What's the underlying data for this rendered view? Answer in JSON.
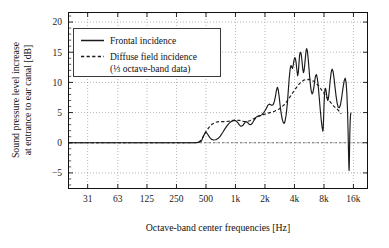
{
  "chart_data": {
    "type": "line",
    "title": "",
    "xlabel": "Octave-band center frequencies [Hz]",
    "ylabel": "Sound pressure level increase at entrance to ear canal [dB]",
    "ylabel_line1": "Sound pressure level increase",
    "ylabel_line2": "at entrance to ear canal [dB]",
    "xscale": "log",
    "xlim": [
      20,
      22000
    ],
    "ylim": [
      -7.5,
      21.5
    ],
    "grid": true,
    "legend_position": "upper-left-inside",
    "xticks": [
      31,
      63,
      125,
      250,
      500,
      1000,
      2000,
      4000,
      8000,
      16000
    ],
    "xticklabels": [
      "31",
      "63",
      "125",
      "250",
      "500",
      "1k",
      "2k",
      "4k",
      "8k",
      "16k"
    ],
    "yticks": [
      -5,
      0,
      5,
      10,
      15,
      20
    ],
    "yticklabels": [
      "−5",
      "0",
      "5",
      "10",
      "15",
      "20"
    ],
    "series": [
      {
        "name": "Frontal incidence",
        "style": "solid",
        "color": "#1a1a1a",
        "points": [
          [
            20,
            0.0
          ],
          [
            100,
            0.0
          ],
          [
            200,
            0.0
          ],
          [
            300,
            0.0
          ],
          [
            380,
            0.0
          ],
          [
            420,
            0.05
          ],
          [
            450,
            0.3
          ],
          [
            470,
            1.1
          ],
          [
            490,
            1.6
          ],
          [
            505,
            1.7
          ],
          [
            520,
            1.4
          ],
          [
            545,
            0.9
          ],
          [
            570,
            0.55
          ],
          [
            600,
            0.45
          ],
          [
            630,
            0.5
          ],
          [
            670,
            0.75
          ],
          [
            700,
            1.1
          ],
          [
            740,
            1.7
          ],
          [
            780,
            2.3
          ],
          [
            820,
            2.8
          ],
          [
            860,
            3.2
          ],
          [
            900,
            3.5
          ],
          [
            940,
            3.65
          ],
          [
            980,
            3.7
          ],
          [
            1020,
            3.6
          ],
          [
            1060,
            3.3
          ],
          [
            1090,
            3.0
          ],
          [
            1120,
            2.8
          ],
          [
            1160,
            2.75
          ],
          [
            1200,
            2.95
          ],
          [
            1240,
            3.3
          ],
          [
            1280,
            3.5
          ],
          [
            1320,
            3.4
          ],
          [
            1360,
            3.15
          ],
          [
            1400,
            3.0
          ],
          [
            1450,
            3.05
          ],
          [
            1500,
            3.35
          ],
          [
            1560,
            3.8
          ],
          [
            1620,
            4.2
          ],
          [
            1680,
            4.4
          ],
          [
            1740,
            4.45
          ],
          [
            1800,
            4.5
          ],
          [
            1870,
            4.7
          ],
          [
            1940,
            5.0
          ],
          [
            2000,
            5.3
          ],
          [
            2070,
            5.7
          ],
          [
            2140,
            6.2
          ],
          [
            2210,
            6.4
          ],
          [
            2280,
            6.3
          ],
          [
            2350,
            6.2
          ],
          [
            2420,
            6.3
          ],
          [
            2490,
            6.8
          ],
          [
            2560,
            7.7
          ],
          [
            2620,
            8.7
          ],
          [
            2680,
            9.2
          ],
          [
            2730,
            8.8
          ],
          [
            2790,
            7.7
          ],
          [
            2850,
            6.3
          ],
          [
            2920,
            5.0
          ],
          [
            2990,
            4.0
          ],
          [
            3060,
            3.4
          ],
          [
            3130,
            3.2
          ],
          [
            3200,
            3.5
          ],
          [
            3290,
            4.6
          ],
          [
            3380,
            6.4
          ],
          [
            3460,
            8.6
          ],
          [
            3540,
            10.8
          ],
          [
            3620,
            12.3
          ],
          [
            3690,
            12.8
          ],
          [
            3760,
            12.5
          ],
          [
            3820,
            12.3
          ],
          [
            3890,
            12.9
          ],
          [
            3960,
            13.7
          ],
          [
            4030,
            14.1
          ],
          [
            4100,
            13.9
          ],
          [
            4170,
            13.1
          ],
          [
            4240,
            12.0
          ],
          [
            4310,
            11.1
          ],
          [
            4380,
            11.6
          ],
          [
            4450,
            13.2
          ],
          [
            4520,
            14.6
          ],
          [
            4590,
            15.0
          ],
          [
            4660,
            14.9
          ],
          [
            4730,
            14.2
          ],
          [
            4800,
            13.1
          ],
          [
            4870,
            12.1
          ],
          [
            4940,
            11.6
          ],
          [
            5010,
            11.9
          ],
          [
            5090,
            12.9
          ],
          [
            5170,
            14.1
          ],
          [
            5250,
            15.2
          ],
          [
            5330,
            15.6
          ],
          [
            5420,
            15.2
          ],
          [
            5510,
            14.1
          ],
          [
            5610,
            12.6
          ],
          [
            5710,
            11.0
          ],
          [
            5820,
            9.6
          ],
          [
            5930,
            8.6
          ],
          [
            6050,
            8.1
          ],
          [
            6170,
            8.3
          ],
          [
            6300,
            9.1
          ],
          [
            6430,
            10.2
          ],
          [
            6570,
            11.1
          ],
          [
            6710,
            11.3
          ],
          [
            6860,
            10.6
          ],
          [
            7010,
            9.2
          ],
          [
            7170,
            7.4
          ],
          [
            7330,
            5.5
          ],
          [
            7500,
            3.8
          ],
          [
            7670,
            2.5
          ],
          [
            7800,
            1.9
          ],
          [
            7860,
            2.3
          ],
          [
            7930,
            4.0
          ],
          [
            8010,
            6.2
          ],
          [
            8100,
            8.0
          ],
          [
            8200,
            8.9
          ],
          [
            8320,
            9.0
          ],
          [
            8450,
            8.4
          ],
          [
            8590,
            7.5
          ],
          [
            8740,
            7.0
          ],
          [
            8900,
            7.4
          ],
          [
            9070,
            8.7
          ],
          [
            9260,
            10.3
          ],
          [
            9460,
            11.6
          ],
          [
            9670,
            12.2
          ],
          [
            9890,
            11.9
          ],
          [
            10120,
            10.8
          ],
          [
            10360,
            9.3
          ],
          [
            10620,
            7.8
          ],
          [
            10890,
            6.6
          ],
          [
            11180,
            5.9
          ],
          [
            11480,
            5.8
          ],
          [
            11800,
            6.3
          ],
          [
            12140,
            7.5
          ],
          [
            12500,
            9.0
          ],
          [
            12880,
            10.3
          ],
          [
            13190,
            10.7
          ],
          [
            13460,
            10.0
          ],
          [
            13700,
            8.2
          ],
          [
            13920,
            5.4
          ],
          [
            14100,
            2.0
          ],
          [
            14250,
            -1.6
          ],
          [
            14370,
            -4.0
          ],
          [
            14450,
            -4.6
          ],
          [
            14520,
            -3.5
          ],
          [
            14600,
            -1.0
          ],
          [
            14700,
            1.6
          ],
          [
            14820,
            3.6
          ],
          [
            14960,
            4.7
          ],
          [
            15080,
            5.0
          ]
        ]
      },
      {
        "name": "Diffuse field incidence",
        "sublabel": "(⅓ octave-band data)",
        "style": "dashed",
        "color": "#1a1a1a",
        "points": [
          [
            20,
            0.0
          ],
          [
            100,
            0.0
          ],
          [
            200,
            0.0
          ],
          [
            300,
            0.0
          ],
          [
            390,
            0.0
          ],
          [
            420,
            0.1
          ],
          [
            450,
            0.5
          ],
          [
            480,
            1.3
          ],
          [
            500,
            1.9
          ],
          [
            540,
            2.6
          ],
          [
            580,
            3.1
          ],
          [
            630,
            3.4
          ],
          [
            680,
            3.5
          ],
          [
            740,
            3.5
          ],
          [
            800,
            3.5
          ],
          [
            880,
            3.6
          ],
          [
            950,
            3.7
          ],
          [
            1000,
            3.75
          ],
          [
            1100,
            3.7
          ],
          [
            1200,
            3.55
          ],
          [
            1300,
            3.5
          ],
          [
            1400,
            3.65
          ],
          [
            1500,
            3.9
          ],
          [
            1600,
            4.15
          ],
          [
            1800,
            4.5
          ],
          [
            2000,
            4.75
          ],
          [
            2200,
            4.95
          ],
          [
            2500,
            5.2
          ],
          [
            2800,
            5.6
          ],
          [
            3150,
            6.3
          ],
          [
            3500,
            7.3
          ],
          [
            4000,
            8.7
          ],
          [
            4500,
            9.8
          ],
          [
            5000,
            10.4
          ],
          [
            5600,
            10.5
          ],
          [
            6300,
            10.2
          ],
          [
            7100,
            9.4
          ],
          [
            8000,
            8.2
          ],
          [
            9000,
            7.0
          ],
          [
            10000,
            6.1
          ],
          [
            11200,
            5.4
          ],
          [
            12000,
            4.8
          ]
        ]
      }
    ]
  },
  "legend": {
    "entries": [
      {
        "label": "Frontal incidence",
        "style": "solid"
      },
      {
        "label": "Diffuse field incidence",
        "style": "dashed"
      },
      {
        "label": "(⅓ octave-band data)",
        "style": "none"
      }
    ]
  },
  "colors": {
    "line": "#1a1a1a",
    "grid": "#9a9a9a",
    "axis": "#111111",
    "background": "#ffffff"
  }
}
